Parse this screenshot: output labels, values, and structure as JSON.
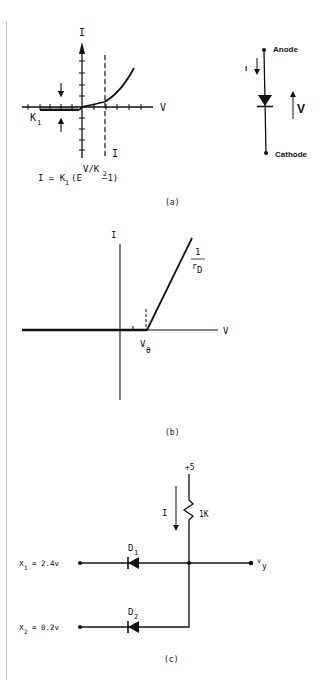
{
  "figure_a": {
    "graph": {
      "y_axis_label": "I",
      "x_axis_label": "V",
      "saturation_label": "K",
      "saturation_sub": "1",
      "dashed_line_label": "I",
      "formula_prefix": "I = K",
      "formula_k1_sub": "1",
      "formula_paren": "(E",
      "formula_exp_main": "V/K",
      "formula_exp_sub": "2",
      "formula_suffix": "–1)"
    },
    "diode_symbol": {
      "anode_label": "Anode",
      "cathode_label": "Cathode",
      "current_label": "I",
      "voltage_label": "V"
    },
    "caption": "(a)"
  },
  "figure_b": {
    "y_axis_label": "I",
    "x_axis_label": "V",
    "threshold_label": "V",
    "threshold_sub": "θ",
    "slope_numerator": "1",
    "slope_denominator": "r",
    "slope_denominator_sub": "D",
    "caption": "(b)"
  },
  "figure_c": {
    "supply_label": "+5",
    "resistor_label": "1K",
    "current_label": "I",
    "diode1_label": "D",
    "diode1_sub": "1",
    "diode2_label": "D",
    "diode2_sub": "2",
    "input1_var": "x",
    "input1_sub": "1",
    "input1_value": "= 2.4v",
    "input2_var": "x",
    "input2_sub": "2",
    "input2_value": "= 0.2v",
    "output_var": "v",
    "output_sub": "y",
    "caption": "(c)"
  },
  "colors": {
    "ink": "#111111",
    "page_border": "#b8b8b8",
    "background": "#ffffff"
  }
}
